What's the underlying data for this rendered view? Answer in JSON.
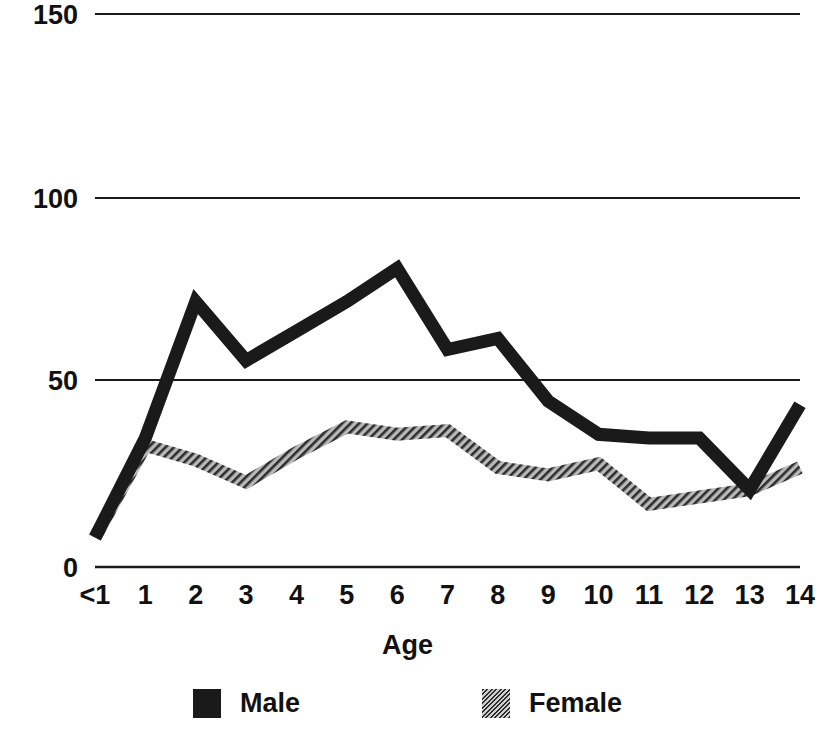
{
  "chart_data": {
    "type": "line",
    "title": "",
    "subtitle": "",
    "xlabel": "Age",
    "ylabel": "",
    "categories": [
      "<1",
      "1",
      "2",
      "3",
      "4",
      "5",
      "6",
      "7",
      "8",
      "9",
      "10",
      "11",
      "12",
      "13",
      "14"
    ],
    "ylim": [
      0,
      150
    ],
    "yticks": [
      0,
      50,
      100,
      150
    ],
    "ytick_labels": [
      "0",
      "50",
      "100",
      "150"
    ],
    "grid": true,
    "legend_position": "bottom",
    "series": [
      {
        "name": "Male",
        "style": "solid-black",
        "color": "#1a1a1a",
        "values": [
          8,
          35,
          72,
          56,
          64,
          72,
          81,
          59,
          62,
          45,
          36,
          35,
          35,
          21,
          44
        ]
      },
      {
        "name": "Female",
        "style": "hatched-gray",
        "color": "#6b6b6b",
        "values": [
          8,
          33,
          29,
          23,
          31,
          38,
          36,
          37,
          27,
          25,
          28,
          17,
          19,
          21,
          27
        ]
      }
    ]
  },
  "axes": {
    "y_tick_150": "150",
    "y_tick_100": "100",
    "y_tick_50": "50",
    "y_tick_0": "0",
    "x_title": "Age"
  },
  "legend": {
    "male_label": "Male",
    "female_label": "Female"
  }
}
